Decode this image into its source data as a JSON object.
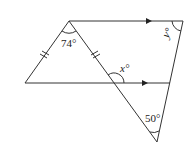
{
  "figure": {
    "points": {
      "apex": [
        69,
        21
      ],
      "top_right": [
        183,
        21
      ],
      "left": [
        25,
        83
      ],
      "lower_right": [
        170,
        83
      ],
      "bottom": [
        157,
        142
      ],
      "cross": [
        114,
        83
      ]
    },
    "angles": {
      "apex_angle": {
        "value": "74°"
      },
      "x_angle": {
        "value": "x°"
      },
      "y_angle": {
        "value": "y°"
      },
      "bottom_angle": {
        "value": "50°"
      }
    },
    "markings": {
      "equal_sides": [
        "apex-left",
        "apex-cross"
      ],
      "parallel_lines": [
        "apex-top_right",
        "left-lower_right"
      ]
    }
  }
}
